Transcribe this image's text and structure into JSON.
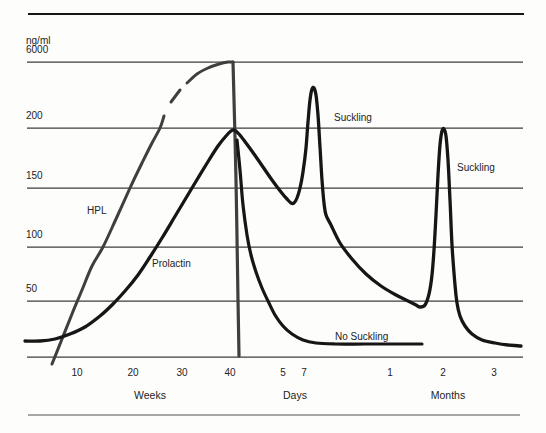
{
  "figure": {
    "kind": "hormone-curve-figure",
    "background": "#fdfdfc",
    "ink_color": "#1a1a1a",
    "hpl_color": "#3f3f3f",
    "grid_color": "#3c3c3c",
    "bottom_rule_color": "#8a8a8a"
  },
  "chart_data": {
    "type": "line",
    "title": "",
    "ylabel": "ng/ml",
    "y_scale": "broken scale: 50,100,150,200 then 6000 at top",
    "y_unit_label": {
      "text": "ng/ml",
      "x": 26,
      "y": 44
    },
    "plot": {
      "x0": 27,
      "x1": 523,
      "baseline_y": 357
    },
    "frame": {
      "top_rule": {
        "y": 14,
        "x1": 28,
        "x2": 524,
        "width": 2.2,
        "color": "#161616"
      },
      "bottom_rule": {
        "y": 415,
        "x1": 28,
        "x2": 520,
        "width": 1.6,
        "color": "#8a8a8a"
      }
    },
    "y_ticks": [
      {
        "label": "6000",
        "y": 62
      },
      {
        "label": "200",
        "y": 128
      },
      {
        "label": "150",
        "y": 188
      },
      {
        "label": "100",
        "y": 247
      },
      {
        "label": "50",
        "y": 301
      },
      {
        "label": "",
        "y": 357
      }
    ],
    "x_groups": [
      {
        "label": "Weeks",
        "label_x": 150,
        "ticks": [
          {
            "label": "10",
            "x": 77
          },
          {
            "label": "20",
            "x": 133
          },
          {
            "label": "30",
            "x": 182
          },
          {
            "label": "40",
            "x": 230
          }
        ]
      },
      {
        "label": "Days",
        "label_x": 295,
        "ticks": [
          {
            "label": "5",
            "x": 283
          },
          {
            "label": "7",
            "x": 304
          }
        ]
      },
      {
        "label": "Months",
        "label_x": 448,
        "ticks": [
          {
            "label": "1",
            "x": 390
          },
          {
            "label": "2",
            "x": 443
          },
          {
            "label": "3",
            "x": 494
          }
        ]
      }
    ],
    "tick_label_y": 376,
    "group_label_y": 399,
    "annotations": [
      {
        "text": "HPL",
        "x": 87,
        "y": 214
      },
      {
        "text": "Prolactin",
        "x": 152,
        "y": 267
      },
      {
        "text": "Suckling",
        "x": 334,
        "y": 121
      },
      {
        "text": "Suckling",
        "x": 457,
        "y": 171
      },
      {
        "text": "No Suckling",
        "x": 335,
        "y": 340
      }
    ],
    "series": [
      {
        "name": "hpl-rise",
        "legend": "HPL",
        "color": "#3f3f3f",
        "width": 3,
        "peak_readout": "~6000 ng/ml at 40 weeks",
        "points": [
          [
            52,
            364
          ],
          [
            62,
            339
          ],
          [
            72,
            314
          ],
          [
            82,
            290
          ],
          [
            92,
            266
          ],
          [
            103,
            247
          ],
          [
            116,
            219
          ],
          [
            130,
            188
          ],
          [
            142,
            163
          ],
          [
            152,
            143
          ],
          [
            160,
            128
          ],
          [
            164,
            116
          ]
        ]
      },
      {
        "name": "hpl-dash",
        "legend": "HPL (dashed break)",
        "color": "#3f3f3f",
        "width": 3,
        "points": [
          [
            171,
            102
          ],
          [
            180,
            90
          ]
        ]
      },
      {
        "name": "hpl-peak",
        "legend": "HPL",
        "color": "#3f3f3f",
        "width": 3,
        "points": [
          [
            187,
            83
          ],
          [
            197,
            74
          ],
          [
            208,
            68
          ],
          [
            219,
            64
          ],
          [
            228,
            62
          ],
          [
            233,
            62
          ]
        ]
      },
      {
        "name": "hpl-delivery-drop",
        "legend": "HPL drop at delivery",
        "color": "#3f3f3f",
        "width": 3.2,
        "points": [
          [
            233,
            62
          ],
          [
            236,
            180
          ],
          [
            238,
            300
          ],
          [
            239,
            356
          ]
        ]
      },
      {
        "name": "prolactin-suckling",
        "legend": "Prolactin (suckling)",
        "color": "#161616",
        "width": 3.3,
        "peak_readout": "~200 ng/ml at 40 weeks; spikes with suckling at day 7 and month 2",
        "points": [
          [
            25,
            341
          ],
          [
            40,
            341
          ],
          [
            55,
            339
          ],
          [
            70,
            334
          ],
          [
            85,
            327
          ],
          [
            100,
            316
          ],
          [
            113,
            304
          ],
          [
            125,
            291
          ],
          [
            138,
            275
          ],
          [
            150,
            257
          ],
          [
            162,
            238
          ],
          [
            174,
            218
          ],
          [
            186,
            198
          ],
          [
            198,
            178
          ],
          [
            209,
            160
          ],
          [
            218,
            146
          ],
          [
            226,
            136
          ],
          [
            231,
            131
          ],
          [
            234,
            130
          ],
          [
            239,
            134
          ],
          [
            246,
            143
          ],
          [
            254,
            154
          ],
          [
            263,
            167
          ],
          [
            272,
            180
          ],
          [
            281,
            192
          ],
          [
            287,
            199
          ],
          [
            291,
            203
          ],
          [
            294,
            203
          ],
          [
            297,
            198
          ],
          [
            300,
            188
          ],
          [
            303,
            172
          ],
          [
            306,
            148
          ],
          [
            308,
            122
          ],
          [
            310,
            100
          ],
          [
            312,
            89
          ],
          [
            314,
            88
          ],
          [
            316,
            95
          ],
          [
            318,
            115
          ],
          [
            320,
            147
          ],
          [
            322,
            180
          ],
          [
            324,
            203
          ],
          [
            326,
            215
          ],
          [
            331,
            225
          ],
          [
            340,
            243
          ],
          [
            352,
            259
          ],
          [
            366,
            274
          ],
          [
            381,
            286
          ],
          [
            396,
            295
          ],
          [
            408,
            301
          ],
          [
            416,
            305
          ],
          [
            420,
            307
          ],
          [
            425,
            305
          ],
          [
            429,
            294
          ],
          [
            432,
            275
          ],
          [
            434,
            250
          ],
          [
            436,
            215
          ],
          [
            438,
            175
          ],
          [
            440,
            145
          ],
          [
            442,
            131
          ],
          [
            444,
            129
          ],
          [
            446,
            136
          ],
          [
            448,
            160
          ],
          [
            450,
            200
          ],
          [
            452,
            245
          ],
          [
            455,
            285
          ],
          [
            457,
            303
          ],
          [
            460,
            316
          ],
          [
            465,
            326
          ],
          [
            472,
            334
          ],
          [
            482,
            340
          ],
          [
            495,
            343
          ],
          [
            508,
            345
          ],
          [
            521,
            346
          ]
        ]
      },
      {
        "name": "prolactin-no-suckling",
        "legend": "Prolactin (no suckling)",
        "color": "#161616",
        "width": 3.2,
        "readout": "falls to low baseline within ~1 week without suckling",
        "points": [
          [
            237,
            140
          ],
          [
            240,
            170
          ],
          [
            243,
            205
          ],
          [
            247,
            235
          ],
          [
            251,
            255
          ],
          [
            256,
            272
          ],
          [
            262,
            288
          ],
          [
            268,
            301
          ],
          [
            275,
            315
          ],
          [
            283,
            326
          ],
          [
            292,
            334
          ],
          [
            303,
            340
          ],
          [
            316,
            343
          ],
          [
            335,
            344
          ],
          [
            365,
            344
          ],
          [
            395,
            344
          ],
          [
            422,
            344
          ]
        ]
      }
    ]
  }
}
